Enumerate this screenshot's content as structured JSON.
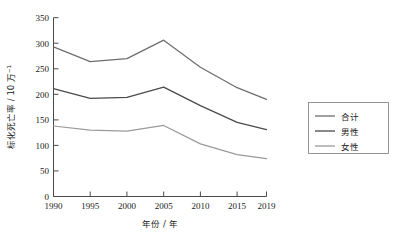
{
  "chart_data": {
    "type": "line",
    "title": "",
    "subtitle": "",
    "xlabel": "年份 / 年",
    "ylabel": "标化死亡率 / 10 万⁻¹",
    "x": [
      1990,
      1995,
      2000,
      2005,
      2010,
      2015,
      2019
    ],
    "xticklabels": [
      "1990",
      "1995",
      "2000",
      "2005",
      "2010",
      "2015",
      "2019"
    ],
    "yticks": [
      0,
      50,
      100,
      150,
      200,
      250,
      300,
      350
    ],
    "yticklabels": [
      "0",
      "50",
      "100",
      "150",
      "200",
      "250",
      "300",
      "350"
    ],
    "xlim": [
      1990,
      2019
    ],
    "ylim": [
      0,
      350
    ],
    "grid": false,
    "legend_position": "right",
    "series": [
      {
        "name": "合计",
        "color": "#6e6e6e",
        "values": [
          293,
          264,
          270,
          306,
          253,
          213,
          190
        ]
      },
      {
        "name": "男性",
        "color": "#4a4a4a",
        "values": [
          211,
          192,
          194,
          214,
          178,
          145,
          131
        ]
      },
      {
        "name": "女性",
        "color": "#9a9a9a",
        "values": [
          138,
          130,
          128,
          139,
          103,
          82,
          74
        ]
      }
    ]
  },
  "axes": {
    "y_axis_title": "标化死亡率 / 10 万⁻¹",
    "x_axis_title": "年份 / 年",
    "y_tick_0": "0",
    "y_tick_50": "50",
    "y_tick_100": "100",
    "y_tick_150": "150",
    "y_tick_200": "200",
    "y_tick_250": "250",
    "y_tick_300": "300",
    "y_tick_350": "350",
    "x_tick_1990": "1990",
    "x_tick_1995": "1995",
    "x_tick_2000": "2000",
    "x_tick_2005": "2005",
    "x_tick_2010": "2010",
    "x_tick_2015": "2015",
    "x_tick_2019": "2019"
  },
  "legend": {
    "items": [
      {
        "label": "合计",
        "color": "#6e6e6e"
      },
      {
        "label": "男性",
        "color": "#4a4a4a"
      },
      {
        "label": "女性",
        "color": "#9a9a9a"
      }
    ]
  },
  "colors": {
    "axis": "#4a4a4a",
    "text": "#1a1a1a",
    "background": "#ffffff",
    "legend_border": "#8a8a8a"
  }
}
